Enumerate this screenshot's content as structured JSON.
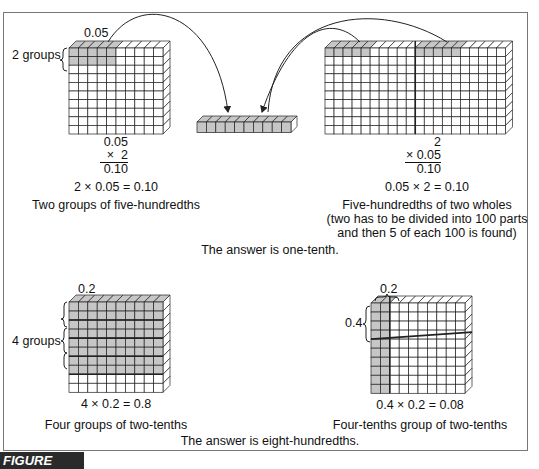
{
  "figure_label": "FIGURE 10.23",
  "colors": {
    "shade": "#c6c6c6",
    "line": "#222222",
    "frame": "#777777",
    "label_bg": "#2a2a2a"
  },
  "top_left": {
    "top_label": "0.05",
    "side_label": "2 groups",
    "fraction": {
      "line1": "0.05",
      "line2": "×  2",
      "result": "0.10"
    },
    "equation": "2 × 0.05 = 0.10",
    "caption": "Two groups of five-hundredths"
  },
  "top_right": {
    "fraction": {
      "line1": "2",
      "line2": "× 0.05",
      "result": "0.10"
    },
    "equation": "0.05 × 2 = 0.10",
    "caption_line1": "Five-hundredths of two wholes",
    "caption_line2": "(two has to be divided into 100 parts",
    "caption_line3": "and then 5 of each 100 is found)"
  },
  "answer_top": "The answer is one-tenth.",
  "bottom_left": {
    "top_label": "0.2",
    "side_label": "4 groups",
    "equation": "4 × 0.2 = 0.8",
    "caption": "Four groups of two-tenths"
  },
  "bottom_right": {
    "top_label": "0.2",
    "side_label": "0.4",
    "equation": "0.4 × 0.2 = 0.08",
    "caption": "Four-tenths group of two-tenths"
  },
  "answer_bottom": "The answer is eight-hundredths."
}
